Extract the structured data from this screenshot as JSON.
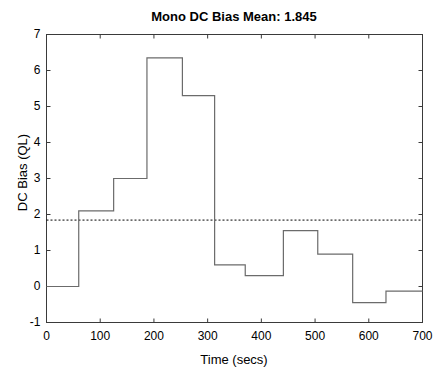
{
  "figure": {
    "width": 447,
    "height": 380,
    "background": "#ffffff",
    "axes_color": "#3a3a3a",
    "line_color": "#6b6b6b",
    "mean_line_color": "#000000"
  },
  "chart_data": {
    "type": "line",
    "style": "step-post",
    "title": "Mono DC Bias Mean: 1.845",
    "xlabel": "Time (secs)",
    "ylabel": "DC Bias (QL)",
    "xlim": [
      0,
      700
    ],
    "ylim": [
      -1,
      7
    ],
    "xticks": [
      0,
      100,
      200,
      300,
      400,
      500,
      600,
      700
    ],
    "yticks": [
      -1,
      0,
      1,
      2,
      3,
      4,
      5,
      6,
      7
    ],
    "xtick_labels": [
      "0",
      "100",
      "200",
      "300",
      "400",
      "500",
      "600",
      "700"
    ],
    "ytick_labels": [
      "-1",
      "0",
      "1",
      "2",
      "3",
      "4",
      "5",
      "6",
      "7"
    ],
    "grid": false,
    "legend": null,
    "mean_value": 1.845,
    "mean_line_label": "Mean 1.845",
    "steps": [
      {
        "x_start": 0,
        "x_end": 60,
        "y": 0.0
      },
      {
        "x_start": 60,
        "x_end": 125,
        "y": 2.1
      },
      {
        "x_start": 125,
        "x_end": 187,
        "y": 3.0
      },
      {
        "x_start": 187,
        "x_end": 253,
        "y": 6.35
      },
      {
        "x_start": 253,
        "x_end": 313,
        "y": 5.3
      },
      {
        "x_start": 313,
        "x_end": 370,
        "y": 0.6
      },
      {
        "x_start": 370,
        "x_end": 441,
        "y": 0.3
      },
      {
        "x_start": 441,
        "x_end": 505,
        "y": 1.55
      },
      {
        "x_start": 505,
        "x_end": 570,
        "y": 0.9
      },
      {
        "x_start": 570,
        "x_end": 632,
        "y": -0.45
      },
      {
        "x_start": 632,
        "x_end": 700,
        "y": -0.13
      }
    ]
  }
}
